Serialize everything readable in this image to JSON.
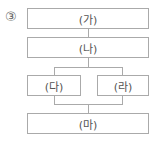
{
  "marker": "③",
  "boxes": {
    "ga": "(가)",
    "na": "(나)",
    "da": "(다)",
    "ra": "(라)",
    "ma": "(마)"
  }
}
